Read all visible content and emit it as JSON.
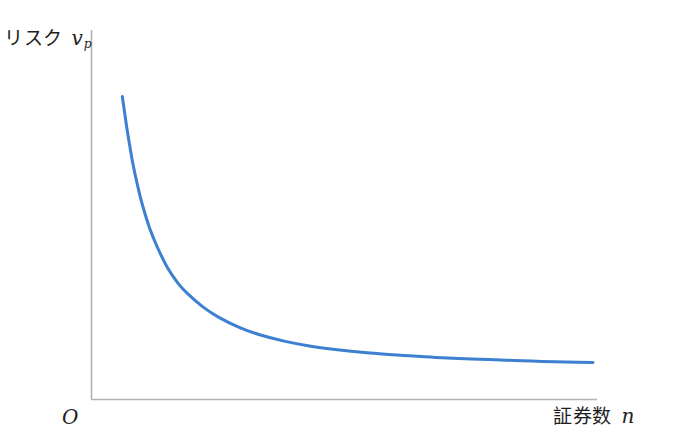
{
  "figure": {
    "background_color": "#ffffff",
    "axis_color": "#b3b3b3",
    "curve_color": "#3d7fd0"
  },
  "axes": {
    "y_label_text": "リスク",
    "y_label_symbol": "v",
    "y_label_subscript": "p",
    "x_label_text": "証券数",
    "x_label_symbol": "n",
    "origin_label": "O"
  },
  "chart_data": {
    "type": "line",
    "title": "",
    "subtitle": "",
    "xlabel": "証券数 n",
    "ylabel": "リスク v_p",
    "grid": false,
    "legend": false,
    "legend_position": "none",
    "xlim": [
      0,
      100
    ],
    "ylim": [
      0,
      100
    ],
    "axis_ticks": {
      "x": [],
      "y": []
    },
    "annotations": [
      {
        "text": "O",
        "x": 0,
        "y": 0,
        "role": "origin-marker"
      }
    ],
    "series": [
      {
        "name": "ポートフォリオのリスク",
        "color": "#3d7fd0",
        "line_width": 3,
        "description": "decaying hyperbola approaching a non-zero asymptote (systematic risk)",
        "x": [
          6.1,
          7.1,
          8.1,
          9.1,
          10.1,
          11.6,
          13.1,
          15.1,
          17.1,
          19.1,
          22.1,
          25.1,
          29.1,
          33.1,
          38.1,
          43.1,
          49.1,
          55.1,
          61.1,
          68.1,
          75.1,
          82.1,
          89.1,
          96.1,
          99.2
        ],
        "y": [
          82.0,
          72.5,
          64.5,
          58.0,
          52.5,
          46.0,
          41.0,
          35.5,
          31.5,
          28.5,
          25.0,
          22.3,
          19.6,
          17.6,
          15.8,
          14.5,
          13.4,
          12.6,
          12.0,
          11.4,
          11.0,
          10.6,
          10.3,
          10.1,
          10.0
        ]
      }
    ]
  }
}
